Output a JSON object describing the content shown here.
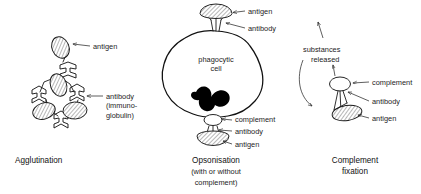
{
  "figure": {
    "background_color": "#ffffff",
    "line_color": "#1a1a1a",
    "text_color": "#1c1c1c"
  },
  "panels": [
    {
      "id": "agglutination",
      "caption": "Agglutination",
      "labels": [
        {
          "id": "antigen",
          "text": "antigen"
        },
        {
          "id": "antibody",
          "text": "antibody"
        },
        {
          "id": "antibody-line2",
          "text": "(immuno-"
        },
        {
          "id": "antibody-line3",
          "text": "globulin)"
        }
      ],
      "elements": [
        {
          "name": "antigen-ellipse",
          "count": 4,
          "fill": "hatched"
        },
        {
          "name": "antibody-fork",
          "count": 4,
          "fill": "white"
        }
      ]
    },
    {
      "id": "opsonisation",
      "caption": "Opsonisation",
      "caption_line2": "(with or without",
      "caption_line3": "complement)",
      "cell_label_line1": "phagocytic",
      "cell_label_line2": "cell",
      "labels": [
        {
          "id": "antigen-top",
          "text": "antigen"
        },
        {
          "id": "antibody-top",
          "text": "antibody"
        },
        {
          "id": "complement-bottom",
          "text": "complement"
        },
        {
          "id": "antibody-bottom",
          "text": "antibody"
        },
        {
          "id": "antigen-bottom",
          "text": "antigen"
        }
      ],
      "elements": [
        {
          "name": "phagocytic-cell-body",
          "fill": "white"
        },
        {
          "name": "nucleus",
          "fill": "black"
        },
        {
          "name": "antigen-cap",
          "count": 2,
          "fill": "hatched"
        },
        {
          "name": "antibody-fork",
          "count": 2,
          "fill": "white"
        },
        {
          "name": "complement-oval",
          "count": 1,
          "fill": "white"
        }
      ]
    },
    {
      "id": "complement-fixation",
      "caption": "Complement",
      "caption_line2": "fixation",
      "released_line1": "substances",
      "released_line2": "released",
      "labels": [
        {
          "id": "complement",
          "text": "complement"
        },
        {
          "id": "antibody",
          "text": "antibody"
        },
        {
          "id": "antigen",
          "text": "antigen"
        }
      ],
      "elements": [
        {
          "name": "complement-oval",
          "fill": "white"
        },
        {
          "name": "antibody-stem",
          "fill": "white"
        },
        {
          "name": "antigen-dome",
          "fill": "hatched"
        },
        {
          "name": "release-arrow-up",
          "fill": "none"
        },
        {
          "name": "curved-arrow",
          "fill": "none"
        }
      ]
    }
  ]
}
